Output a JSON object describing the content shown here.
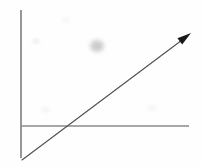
{
  "figure": {
    "title": "Rising trend line graph",
    "background_color": "#fefefe",
    "width": 202,
    "height": 166
  },
  "axes": {
    "vertical": {
      "name": "y-axis",
      "color": "#6b6b70",
      "stroke_width": 1.4,
      "x": 21,
      "y_top": 10,
      "y_bottom": 158,
      "has_arrowhead": false,
      "tick_labels": [],
      "label": ""
    },
    "horizontal": {
      "name": "x-axis",
      "color": "#8a8a8e",
      "stroke_width": 1.5,
      "y": 126,
      "x_left": 21,
      "x_right": 189,
      "has_arrowhead": false,
      "tick_labels": [],
      "label": ""
    }
  },
  "series": {
    "name": "trend-arrow",
    "color": "#4f4f54",
    "stroke_width": 1.1,
    "start": {
      "x": 22,
      "y": 160
    },
    "end": {
      "x": 190,
      "y": 34
    },
    "arrowhead": {
      "present": true,
      "color": "#1a1a1a",
      "tip": {
        "x": 191,
        "y": 33
      },
      "length": 14,
      "width": 8
    },
    "crosses_x_axis_at": {
      "x": 68,
      "y": 126
    }
  },
  "artifacts": [
    {
      "name": "ink-smudge",
      "cx": 97,
      "cy": 46,
      "rx": 7,
      "ry": 6,
      "color": "#b9b9bd",
      "opacity": 0.72
    },
    {
      "name": "paper-speck-left",
      "cx": 36,
      "cy": 41,
      "rx": 4,
      "ry": 3,
      "color": "#eaeaec",
      "opacity": 0.6
    },
    {
      "name": "paper-speck-lower",
      "cx": 46,
      "cy": 110,
      "rx": 5,
      "ry": 3,
      "color": "#efeff1",
      "opacity": 0.55
    },
    {
      "name": "paper-speck-right",
      "cx": 152,
      "cy": 108,
      "rx": 5,
      "ry": 4,
      "color": "#f0f0f2",
      "opacity": 0.5
    },
    {
      "name": "paper-speck-top",
      "cx": 66,
      "cy": 20,
      "rx": 4,
      "ry": 3,
      "color": "#f2f2f4",
      "opacity": 0.5
    }
  ],
  "chart_data": {
    "type": "line",
    "title": "",
    "xlabel": "",
    "ylabel": "",
    "x": [
      0,
      100
    ],
    "series": [
      {
        "name": "trend",
        "values": [
          -27,
          75
        ],
        "color": "#4f4f54",
        "marker": "none",
        "arrow_end": true
      }
    ],
    "xlim": [
      0,
      100
    ],
    "ylim": [
      -30,
      85
    ],
    "grid": false,
    "legend": "none",
    "tick_labels": {
      "x": [],
      "y": []
    },
    "annotations": []
  }
}
